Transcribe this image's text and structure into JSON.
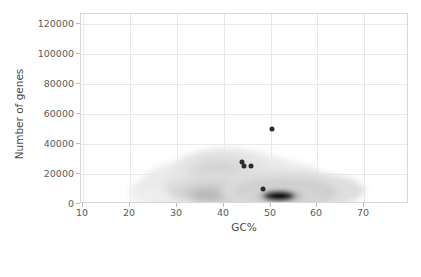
{
  "chart_data": {
    "type": "scatter",
    "title": "",
    "xlabel": "GC%",
    "ylabel": "Number of genes",
    "xlim": [
      7,
      77
    ],
    "ylim": [
      -4000,
      128000
    ],
    "xticks": [
      10,
      20,
      30,
      40,
      50,
      60,
      70
    ],
    "xticklabels": [
      "10",
      "20",
      "30",
      "40",
      "50",
      "60",
      "70"
    ],
    "yticks": [
      0,
      20000,
      40000,
      60000,
      80000,
      100000,
      120000
    ],
    "yticklabels": [
      "0",
      "20000",
      "40000",
      "60000",
      "80000",
      "100000",
      "120000"
    ],
    "grid": true,
    "legend": "none",
    "overlay": "kde-density-contours-grayscale",
    "points": [
      {
        "x": 48.0,
        "y": 47000
      },
      {
        "x": 41.5,
        "y": 24000
      },
      {
        "x": 42.0,
        "y": 21500
      },
      {
        "x": 43.5,
        "y": 21000
      },
      {
        "x": 46.0,
        "y": 5000
      }
    ],
    "density": {
      "description": "grayscale kernel density estimate of genome GC% vs gene count",
      "extent_x": [
        24,
        61
      ],
      "extent_y": [
        0,
        30000
      ],
      "peak": {
        "x": 55.0,
        "y": 4000
      },
      "secondary_modes": [
        {
          "x": 41.0,
          "y": 24000
        },
        {
          "x": 39.0,
          "y": 6000
        },
        {
          "x": 25.0,
          "y": 3000
        }
      ]
    }
  },
  "axes": {
    "x_title": "GC%",
    "y_title": "Number of genes"
  }
}
